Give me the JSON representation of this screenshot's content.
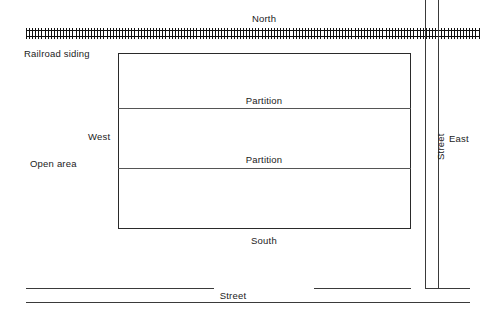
{
  "diagram": {
    "labels": {
      "north": "North",
      "south": "South",
      "east": "East",
      "west": "West",
      "railroad_siding": "Railroad siding",
      "open_area": "Open area",
      "partition_upper": "Partition",
      "partition_lower": "Partition",
      "street_vertical": "Street",
      "street_horizontal": "Street"
    },
    "colors": {
      "background": "#ffffff",
      "rail": "#111111",
      "building_outline": "#2a2a2a",
      "partition": "#555555",
      "street": "#3a3a3a",
      "text": "#1b1b1b"
    }
  }
}
